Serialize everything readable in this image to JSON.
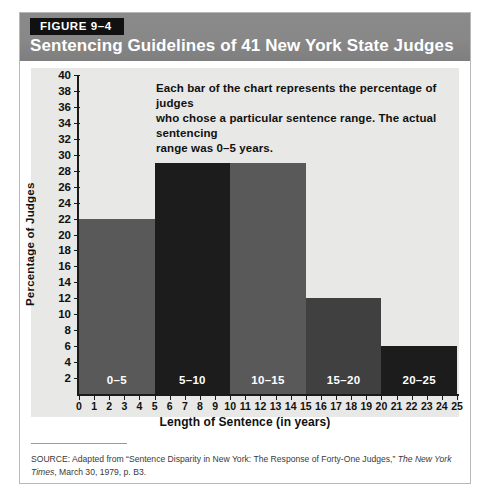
{
  "figure": {
    "badge": "FIGURE 9–4",
    "title": "Sentencing Guidelines of 41 New York State Judges"
  },
  "annotation": {
    "line1": "Each bar of the chart represents the percentage of judges",
    "line2": "who chose a particular sentence range. The actual sentencing",
    "line3": "range was 0–5 years."
  },
  "source": {
    "prefix": "SOURCE: Adapted from “Sentence Disparity in New York: The Response of Forty-One Judges,” ",
    "publication": "The New York Times",
    "suffix": ", March 30, 1979, p. B3."
  },
  "colors": {
    "header_bg": "#888888",
    "badge_bg": "#111111",
    "plot_bg": "#e8e8e6",
    "bar_gray": "#595959",
    "bar_dark": "#1c1c1c",
    "axis": "#1a1a1a"
  },
  "chart_data": {
    "type": "bar",
    "title": "Sentencing Guidelines of 41 New York State Judges",
    "xlabel": "Length of Sentence (in years)",
    "ylabel": "Percentage of Judges",
    "categories": [
      "0–5",
      "5–10",
      "10–15",
      "15–20",
      "20–25"
    ],
    "values": [
      22,
      29,
      29,
      12,
      6
    ],
    "bin_edges": [
      0,
      5,
      10,
      15,
      20,
      25
    ],
    "bar_colors": [
      "#595959",
      "#1c1c1c",
      "#595959",
      "#404040",
      "#1c1c1c"
    ],
    "xlim": [
      0,
      25
    ],
    "ylim": [
      0,
      40
    ],
    "ytick_labels": [
      2,
      4,
      6,
      8,
      10,
      12,
      14,
      16,
      18,
      20,
      22,
      24,
      26,
      28,
      30,
      32,
      34,
      36,
      38,
      40
    ],
    "xtick_labels": [
      0,
      1,
      2,
      3,
      4,
      5,
      6,
      7,
      8,
      9,
      10,
      11,
      12,
      13,
      14,
      15,
      16,
      17,
      18,
      19,
      20,
      21,
      22,
      23,
      24,
      25
    ],
    "grid": false,
    "legend": false
  }
}
